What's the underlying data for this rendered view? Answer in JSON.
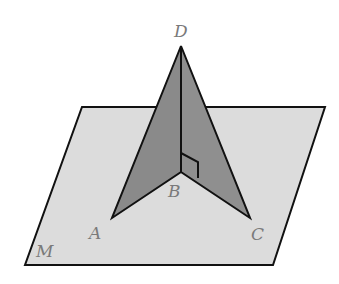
{
  "diagram": {
    "type": "geometry-3d",
    "plane": {
      "label": "M",
      "fill": "#dcdcdc",
      "stroke": "#111111"
    },
    "faces": [
      {
        "name": "ABD",
        "fill": "#8a8a8a"
      },
      {
        "name": "CBD",
        "fill": "#8a8a8a"
      }
    ],
    "points": {
      "D": {
        "label": "D",
        "x": 181,
        "y": 46
      },
      "B": {
        "label": "B",
        "x": 181,
        "y": 172
      },
      "A": {
        "label": "A",
        "x": 112,
        "y": 218
      },
      "C": {
        "label": "C",
        "x": 250,
        "y": 218
      }
    },
    "right_angle_marker": {
      "at": "B",
      "between": [
        "DB",
        "BC"
      ]
    },
    "labels": {
      "D": "D",
      "B": "B",
      "A": "A",
      "C": "C",
      "M": "M"
    },
    "label_color": "#7a7a7a",
    "line_color": "#111111"
  }
}
